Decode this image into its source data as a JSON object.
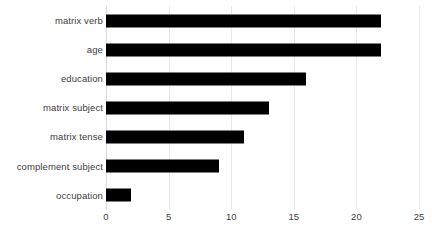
{
  "chart_data": {
    "type": "bar",
    "orientation": "horizontal",
    "title": "",
    "subtitle": "",
    "xlabel": "",
    "ylabel": "",
    "categories": [
      "matrix verb",
      "age",
      "education",
      "matrix subject",
      "matrix tense",
      "complement subject",
      "occupation"
    ],
    "values": [
      22,
      22,
      16,
      13,
      11,
      9,
      2
    ],
    "xlim": [
      0,
      25
    ],
    "xticks": [
      0,
      5,
      10,
      15,
      20,
      25
    ],
    "xtick_labels": [
      "0",
      "5",
      "10",
      "15",
      "20",
      "25"
    ],
    "grid": "vertical",
    "legend": "none",
    "bar_color": "#000000",
    "background_color": "#FFFFFF",
    "gridline_color": "#E8E8E8",
    "text_color": "#404040"
  }
}
